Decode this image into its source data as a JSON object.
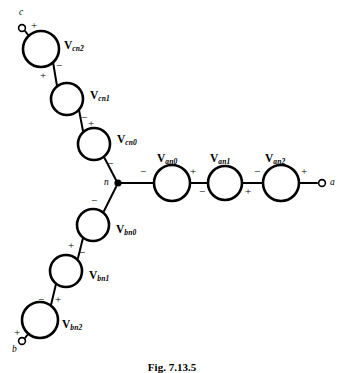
{
  "figure": {
    "caption": "Fig. 7.13.5",
    "background_color": "#ffffff",
    "stroke_color": "#000000"
  },
  "node": {
    "label": "n",
    "name": "neutral-node",
    "x": 118,
    "y": 183
  },
  "terminals": [
    {
      "id": "c",
      "label": "c",
      "x": 22,
      "y": 28,
      "label_x": 19,
      "label_y": 8
    },
    {
      "id": "a",
      "label": "a",
      "x": 322,
      "y": 183,
      "label_x": 330,
      "label_y": 178
    },
    {
      "id": "b",
      "label": "b",
      "x": 22,
      "y": 341,
      "label_x": 12,
      "label_y": 345
    }
  ],
  "branches": [
    {
      "phase": "c",
      "name": "phase-c-branch",
      "sources": [
        {
          "label_main": "V",
          "label_sub": "cn2",
          "cx": 41,
          "cy": 49,
          "r": 18
        },
        {
          "label_main": "V",
          "label_sub": "cn1",
          "cx": 67,
          "cy": 99,
          "r": 16
        },
        {
          "label_main": "V",
          "label_sub": "cn0",
          "cx": 94,
          "cy": 144,
          "r": 16
        }
      ]
    },
    {
      "phase": "a",
      "name": "phase-a-branch",
      "sources": [
        {
          "label_main": "V",
          "label_sub": "an0",
          "cx": 172,
          "cy": 183,
          "r": 18
        },
        {
          "label_main": "V",
          "label_sub": "an1",
          "cx": 225,
          "cy": 183,
          "r": 17
        },
        {
          "label_main": "V",
          "label_sub": "an2",
          "cx": 281,
          "cy": 183,
          "r": 18
        }
      ]
    },
    {
      "phase": "b",
      "name": "phase-b-branch",
      "sources": [
        {
          "label_main": "V",
          "label_sub": "bn0",
          "cx": 93,
          "cy": 225,
          "r": 16
        },
        {
          "label_main": "V",
          "label_sub": "bn1",
          "cx": 66,
          "cy": 271,
          "r": 16
        },
        {
          "label_main": "V",
          "label_sub": "bn2",
          "cx": 40,
          "cy": 320,
          "r": 18
        }
      ]
    }
  ],
  "source_labels": [
    {
      "key": "cn2",
      "main": "V",
      "sub": "cn2",
      "x": 64,
      "y": 40
    },
    {
      "key": "cn1",
      "main": "V",
      "sub": "cn1",
      "x": 90,
      "y": 90
    },
    {
      "key": "cn0",
      "main": "V",
      "sub": "cn0",
      "x": 117,
      "y": 134
    },
    {
      "key": "an0",
      "main": "V",
      "sub": "an0",
      "x": 157,
      "y": 153
    },
    {
      "key": "an1",
      "main": "V",
      "sub": "an1",
      "x": 210,
      "y": 153
    },
    {
      "key": "an2",
      "main": "V",
      "sub": "an2",
      "x": 265,
      "y": 153
    },
    {
      "key": "bn0",
      "main": "V",
      "sub": "bn0",
      "x": 116,
      "y": 224
    },
    {
      "key": "bn1",
      "main": "V",
      "sub": "bn1",
      "x": 89,
      "y": 270
    },
    {
      "key": "bn2",
      "main": "V",
      "sub": "bn2",
      "x": 62,
      "y": 319
    }
  ],
  "polarity_marks": [
    {
      "key": "c-term-plus",
      "sign": "+",
      "x": 31,
      "y": 20
    },
    {
      "key": "cn2-minus",
      "sign": "−",
      "x": 56,
      "y": 60
    },
    {
      "key": "cn1-plus",
      "sign": "+",
      "x": 40,
      "y": 70
    },
    {
      "key": "cn1-minus",
      "sign": "−",
      "x": 81,
      "y": 112
    },
    {
      "key": "cn0-plus",
      "sign": "+",
      "x": 88,
      "y": 118
    },
    {
      "key": "cn0-minus",
      "sign": "−",
      "x": 107,
      "y": 158
    },
    {
      "key": "an0-minus",
      "sign": "−",
      "x": 140,
      "y": 166
    },
    {
      "key": "an0-plus",
      "sign": "+",
      "x": 190,
      "y": 166
    },
    {
      "key": "an1-minus",
      "sign": "−",
      "x": 199,
      "y": 186
    },
    {
      "key": "an1-plus",
      "sign": "+",
      "x": 245,
      "y": 186
    },
    {
      "key": "an2-minus",
      "sign": "−",
      "x": 254,
      "y": 166
    },
    {
      "key": "an2-plus",
      "sign": "+",
      "x": 301,
      "y": 166
    },
    {
      "key": "bn0-minus",
      "sign": "−",
      "x": 91,
      "y": 195
    },
    {
      "key": "bn0-plus",
      "sign": "+",
      "x": 68,
      "y": 240
    },
    {
      "key": "bn1-minus",
      "sign": "−",
      "x": 79,
      "y": 247
    },
    {
      "key": "bn1-plus",
      "sign": "+",
      "x": 55,
      "y": 294
    },
    {
      "key": "bn2-minus",
      "sign": "−",
      "x": 38,
      "y": 294
    },
    {
      "key": "bn2-plus",
      "sign": "+",
      "x": 14,
      "y": 327
    }
  ]
}
